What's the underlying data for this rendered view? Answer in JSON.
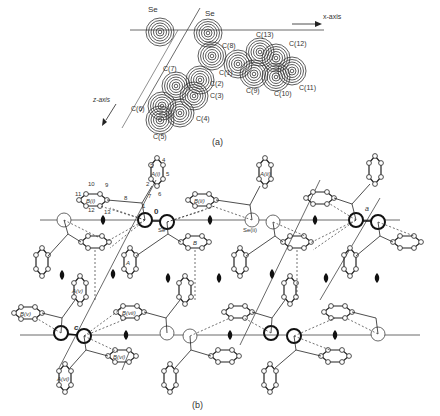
{
  "figure": {
    "panel_a": {
      "caption": "(a)",
      "axis_labels": {
        "x": "x-axis",
        "z": "z-axis"
      },
      "atoms": [
        {
          "label": "Se",
          "x": 160,
          "y": 22,
          "lx": 148,
          "ly": 10
        },
        {
          "label": "Se",
          "x": 208,
          "y": 30,
          "lx": 206,
          "ly": 14
        },
        {
          "label": "C(8)",
          "x": 212,
          "y": 55,
          "lx": 220,
          "ly": 46
        },
        {
          "label": "C(13)",
          "x": 262,
          "y": 50,
          "lx": 257,
          "ly": 36
        },
        {
          "label": "C(12)",
          "x": 294,
          "y": 57,
          "lx": 290,
          "ly": 46
        },
        {
          "label": "C(1)",
          "x": 234,
          "y": 62,
          "lx": 218,
          "ly": 74
        },
        {
          "label": "C(7)",
          "x": 175,
          "y": 86,
          "lx": 162,
          "ly": 70
        },
        {
          "label": "C(2)",
          "x": 200,
          "y": 80,
          "lx": 210,
          "ly": 84
        },
        {
          "label": "C(3)",
          "x": 192,
          "y": 95,
          "lx": 210,
          "ly": 96
        },
        {
          "label": "C(9)",
          "x": 252,
          "y": 75,
          "lx": 246,
          "ly": 92
        },
        {
          "label": "C(10)",
          "x": 275,
          "y": 77,
          "lx": 276,
          "ly": 95
        },
        {
          "label": "C(11)",
          "x": 293,
          "y": 72,
          "lx": 300,
          "ly": 89
        },
        {
          "label": "C(6)",
          "x": 162,
          "y": 106,
          "lx": 132,
          "ly": 110
        },
        {
          "label": "C(4)",
          "x": 180,
          "y": 113,
          "lx": 196,
          "ly": 120
        },
        {
          "label": "C(5)",
          "x": 160,
          "y": 120,
          "lx": 154,
          "ly": 138
        }
      ]
    },
    "panel_b": {
      "caption": "(b)",
      "axis_labels": {
        "origin": "0",
        "a": "a",
        "c": "c"
      },
      "atom_labels": [
        "Se",
        "Se(ii)"
      ],
      "ring_labels": [
        "A(i)",
        "B(i)",
        "A(ii)",
        "B(ii)",
        "A",
        "B",
        "A(v)",
        "B(v)",
        "B(vi)",
        "A(vi)",
        "B(vii)"
      ],
      "atom_numbers": [
        "1",
        "2",
        "3",
        "4",
        "5",
        "6",
        "7",
        "8",
        "9",
        "10",
        "11",
        "12",
        "13"
      ]
    }
  }
}
